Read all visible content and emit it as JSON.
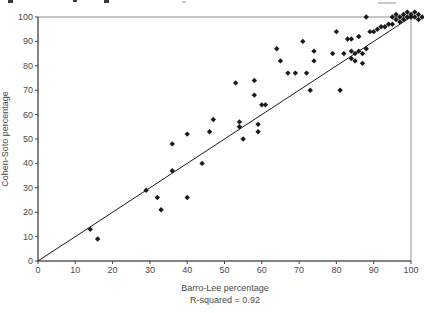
{
  "page": {
    "background": "#ffffff"
  },
  "colors": {
    "axis": "#404040",
    "frame": "#909090",
    "tick_text": "#4a4a4a",
    "marker": "#1a1a1a",
    "line": "#1a1a1a"
  },
  "chart_data": {
    "type": "scatter",
    "title": "",
    "xlabel": "Barro-Lee percentage",
    "ylabel": "Cohen-Soto percentage",
    "annotation": "R-squared = 0.92",
    "xlim": [
      0,
      100
    ],
    "ylim": [
      0,
      100
    ],
    "xticks": [
      0,
      10,
      20,
      30,
      40,
      50,
      60,
      70,
      80,
      90,
      100
    ],
    "yticks": [
      0,
      10,
      20,
      30,
      40,
      50,
      60,
      70,
      80,
      90,
      100
    ],
    "grid": false,
    "legend": "none",
    "marker": {
      "shape": "diamond",
      "color": "#1a1a1a",
      "size": 5
    },
    "reference_line": {
      "name": "identity-line",
      "x1": 0,
      "y1": 0,
      "x2": 100,
      "y2": 100,
      "color": "#1a1a1a"
    },
    "series": [
      {
        "name": "countries",
        "points": [
          [
            14,
            13
          ],
          [
            16,
            9
          ],
          [
            29,
            29
          ],
          [
            32,
            26
          ],
          [
            33,
            21
          ],
          [
            36,
            37
          ],
          [
            36,
            48
          ],
          [
            40,
            26
          ],
          [
            40,
            52
          ],
          [
            44,
            40
          ],
          [
            46,
            53
          ],
          [
            47,
            58
          ],
          [
            53,
            73
          ],
          [
            54,
            55
          ],
          [
            54,
            57
          ],
          [
            55,
            50
          ],
          [
            58,
            68
          ],
          [
            58,
            74
          ],
          [
            59,
            53
          ],
          [
            59,
            56
          ],
          [
            60,
            64
          ],
          [
            61,
            64
          ],
          [
            64,
            87
          ],
          [
            65,
            82
          ],
          [
            67,
            77
          ],
          [
            69,
            77
          ],
          [
            71,
            90
          ],
          [
            72,
            77
          ],
          [
            73,
            70
          ],
          [
            74,
            82
          ],
          [
            74,
            86
          ],
          [
            79,
            85
          ],
          [
            80,
            94
          ],
          [
            81,
            70
          ],
          [
            82,
            85
          ],
          [
            83,
            91
          ],
          [
            84,
            83
          ],
          [
            84,
            86
          ],
          [
            84,
            91
          ],
          [
            85,
            82
          ],
          [
            85,
            85
          ],
          [
            86,
            86
          ],
          [
            86,
            92
          ],
          [
            87,
            81
          ],
          [
            87,
            85
          ],
          [
            88,
            87
          ],
          [
            88,
            100
          ],
          [
            89,
            94
          ],
          [
            90,
            94
          ],
          [
            91,
            95
          ],
          [
            92,
            96
          ],
          [
            93,
            96
          ],
          [
            94,
            97
          ],
          [
            95,
            97
          ],
          [
            95,
            100
          ],
          [
            96,
            99
          ],
          [
            96,
            101
          ],
          [
            97,
            98
          ],
          [
            97,
            100
          ],
          [
            98,
            99
          ],
          [
            98,
            101
          ],
          [
            99,
            100
          ],
          [
            99,
            102
          ],
          [
            100,
            100
          ],
          [
            100,
            101
          ],
          [
            101,
            100
          ],
          [
            101,
            102
          ],
          [
            102,
            99
          ],
          [
            102,
            101
          ],
          [
            103,
            100
          ]
        ]
      }
    ]
  }
}
